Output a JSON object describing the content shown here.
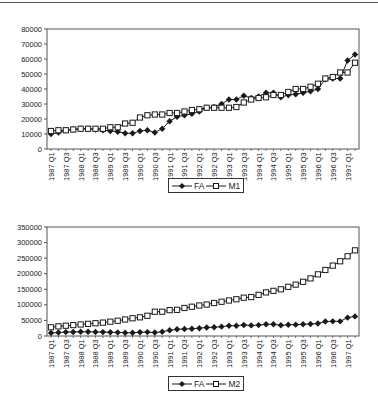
{
  "chart_data": [
    {
      "type": "line",
      "title": "",
      "xlabel": "",
      "ylabel": "",
      "ylim": [
        0,
        80000
      ],
      "yticks": [
        0,
        10000,
        20000,
        30000,
        40000,
        50000,
        60000,
        70000,
        80000
      ],
      "grid": false,
      "legend_position": "bottom",
      "x_tick_labels": [
        "1987 Q1",
        "1987 Q3",
        "1988 Q1",
        "1988 Q3",
        "1989 Q1",
        "1989 Q3",
        "1990 Q1",
        "1990 Q3",
        "1991 Q1",
        "1991 Q3",
        "1992 Q1",
        "1992 Q3",
        "1993 Q1",
        "1993 Q3",
        "1994 Q1",
        "1994 Q3",
        "1995 Q1",
        "1995 Q3",
        "1996 Q1",
        "1996 Q3",
        "1997 Q1"
      ],
      "x": [
        "1987 Q1",
        "1987 Q2",
        "1987 Q3",
        "1987 Q4",
        "1988 Q1",
        "1988 Q2",
        "1988 Q3",
        "1988 Q4",
        "1989 Q1",
        "1989 Q2",
        "1989 Q3",
        "1989 Q4",
        "1990 Q1",
        "1990 Q2",
        "1990 Q3",
        "1990 Q4",
        "1991 Q1",
        "1991 Q2",
        "1991 Q3",
        "1991 Q4",
        "1992 Q1",
        "1992 Q2",
        "1992 Q3",
        "1992 Q4",
        "1993 Q1",
        "1993 Q2",
        "1993 Q3",
        "1993 Q4",
        "1994 Q1",
        "1994 Q2",
        "1994 Q3",
        "1994 Q4",
        "1995 Q1",
        "1995 Q2",
        "1995 Q3",
        "1995 Q4",
        "1996 Q1",
        "1996 Q2",
        "1996 Q3",
        "1996 Q4",
        "1997 Q1",
        "1997 Q2"
      ],
      "series": [
        {
          "name": "FA",
          "marker": "filled-diamond",
          "values": [
            10000,
            11000,
            12500,
            13000,
            13500,
            13500,
            13000,
            12500,
            12000,
            11500,
            10500,
            10500,
            12000,
            12500,
            11000,
            13500,
            18500,
            21500,
            22500,
            23500,
            25000,
            27500,
            28000,
            30000,
            33000,
            33000,
            35500,
            34000,
            35000,
            37500,
            37500,
            34500,
            36000,
            36500,
            37500,
            38500,
            40000,
            46500,
            47000,
            47000,
            59000,
            63000,
            69000
          ]
        },
        {
          "name": "M1",
          "marker": "hollow-square",
          "values": [
            12000,
            12500,
            12500,
            13000,
            13500,
            13500,
            13500,
            13500,
            14500,
            14500,
            17000,
            17500,
            21000,
            22500,
            23000,
            23000,
            24000,
            24000,
            25000,
            26000,
            26500,
            27500,
            27500,
            27500,
            27500,
            28000,
            31000,
            33000,
            34000,
            34500,
            36000,
            36000,
            38000,
            40000,
            40000,
            41500,
            43500,
            47000,
            48000,
            51000,
            51000,
            57500,
            61000
          ]
        }
      ]
    },
    {
      "type": "line",
      "title": "",
      "xlabel": "",
      "ylabel": "",
      "ylim": [
        0,
        350000
      ],
      "yticks": [
        0,
        50000,
        100000,
        150000,
        200000,
        250000,
        300000,
        350000
      ],
      "grid": false,
      "legend_position": "bottom",
      "x_tick_labels": [
        "1987 Q1",
        "1987 Q3",
        "1988 Q1",
        "1988 Q3",
        "1989 Q1",
        "1989 Q3",
        "1990 Q1",
        "1990 Q3",
        "1991 Q1",
        "1991 Q3",
        "1992 Q1",
        "1992 Q3",
        "1993 Q1",
        "1993 Q3",
        "1994 Q1",
        "1994 Q3",
        "1995 Q1",
        "1995 Q3",
        "1996 Q1",
        "1996 Q3",
        "1997 Q1"
      ],
      "x": [
        "1987 Q1",
        "1987 Q2",
        "1987 Q3",
        "1987 Q4",
        "1988 Q1",
        "1988 Q2",
        "1988 Q3",
        "1988 Q4",
        "1989 Q1",
        "1989 Q2",
        "1989 Q3",
        "1989 Q4",
        "1990 Q1",
        "1990 Q2",
        "1990 Q3",
        "1990 Q4",
        "1991 Q1",
        "1991 Q2",
        "1991 Q3",
        "1991 Q4",
        "1992 Q1",
        "1992 Q2",
        "1992 Q3",
        "1992 Q4",
        "1993 Q1",
        "1993 Q2",
        "1993 Q3",
        "1993 Q4",
        "1994 Q1",
        "1994 Q2",
        "1994 Q3",
        "1994 Q4",
        "1995 Q1",
        "1995 Q2",
        "1995 Q3",
        "1995 Q4",
        "1996 Q1",
        "1996 Q2",
        "1996 Q3",
        "1996 Q4",
        "1997 Q1",
        "1997 Q2"
      ],
      "series": [
        {
          "name": "FA",
          "marker": "filled-diamond",
          "values": [
            10000,
            11000,
            12500,
            13000,
            13500,
            13500,
            13000,
            12500,
            12000,
            11500,
            10500,
            10500,
            12000,
            12500,
            11000,
            13500,
            18500,
            21500,
            22500,
            23500,
            25000,
            27500,
            28000,
            30000,
            33000,
            33000,
            35500,
            34000,
            35000,
            37500,
            37500,
            34500,
            36000,
            36500,
            37500,
            38500,
            40000,
            46500,
            47000,
            47000,
            59000,
            63000,
            69000
          ]
        },
        {
          "name": "M2",
          "marker": "hollow-square",
          "values": [
            28000,
            31000,
            33000,
            35000,
            37000,
            39000,
            41000,
            43000,
            46000,
            49000,
            53000,
            57000,
            60000,
            65000,
            78000,
            78000,
            83000,
            84000,
            90000,
            94000,
            98000,
            101000,
            106000,
            110000,
            114000,
            118000,
            123000,
            125000,
            132000,
            140000,
            145000,
            150000,
            158000,
            165000,
            174000,
            185000,
            198000,
            212000,
            226000,
            240000,
            256000,
            275000,
            290000,
            305000
          ]
        }
      ]
    }
  ],
  "legends": [
    {
      "items": [
        {
          "label": "FA"
        },
        {
          "label": "M1"
        }
      ]
    },
    {
      "items": [
        {
          "label": "FA"
        },
        {
          "label": "M2"
        }
      ]
    }
  ],
  "colors": {
    "line": "#1a1a1a",
    "frame": "#555555",
    "background": "#ffffff"
  }
}
